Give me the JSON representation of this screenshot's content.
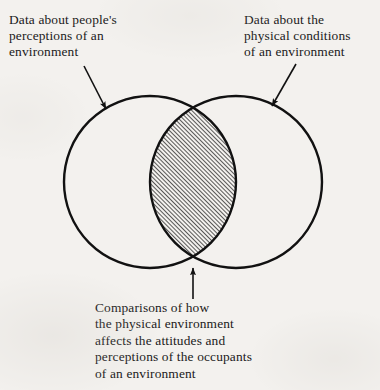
{
  "figure": {
    "type": "venn-diagram",
    "background_color": "#f3f1ee",
    "stroke_color": "#111111",
    "labels": {
      "left": "Data about people's\nperceptions of an\nenvironment",
      "right": "Data about the\nphysical conditions\nof an environment",
      "bottom": "Comparisons of how\nthe physical environment\naffects the attitudes and\nperceptions of the occupants\nof an environment"
    },
    "sets": [
      {
        "name": "perceptions-set",
        "label_ref": "left",
        "center_x": 150,
        "center_y": 182,
        "radius": 86
      },
      {
        "name": "physical-conditions-set",
        "label_ref": "right",
        "center_x": 236,
        "center_y": 182,
        "radius": 86
      }
    ],
    "intersection": {
      "name": "overlap-region",
      "label_ref": "bottom",
      "fill": "diagonal-hatch",
      "hatch_angle_deg": 45,
      "hatch_spacing_px": 3
    },
    "arrows": [
      {
        "name": "arrow-left",
        "from_x": 84,
        "from_y": 66,
        "to_x": 106,
        "to_y": 109
      },
      {
        "name": "arrow-right",
        "from_x": 296,
        "from_y": 64,
        "to_x": 272,
        "to_y": 106
      },
      {
        "name": "arrow-bottom",
        "from_x": 193,
        "from_y": 299,
        "to_x": 193,
        "to_y": 268
      }
    ]
  }
}
